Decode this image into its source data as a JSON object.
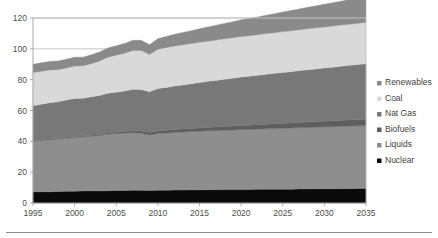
{
  "chart_data": {
    "type": "area",
    "title": "",
    "subtitle": "",
    "xlabel": "",
    "ylabel": "",
    "xlim": [
      1995,
      2035
    ],
    "ylim": [
      0,
      120
    ],
    "yticks": [
      0,
      20,
      40,
      60,
      80,
      100,
      120
    ],
    "xticks": [
      1995,
      2000,
      2005,
      2010,
      2015,
      2020,
      2025,
      2030,
      2035
    ],
    "grid": true,
    "stacked": true,
    "legend_position": "right",
    "x": [
      1995,
      1996,
      1997,
      1998,
      1999,
      2000,
      2001,
      2002,
      2003,
      2004,
      2005,
      2006,
      2007,
      2008,
      2009,
      2010,
      2011,
      2012,
      2013,
      2014,
      2015,
      2016,
      2017,
      2018,
      2019,
      2020,
      2021,
      2022,
      2023,
      2024,
      2025,
      2026,
      2027,
      2028,
      2029,
      2030,
      2031,
      2032,
      2033,
      2034,
      2035
    ],
    "stack_order_bottom_to_top": [
      "Nuclear",
      "Liquids",
      "Biofuels",
      "Nat Gas",
      "Coal",
      "Renewables"
    ],
    "series": [
      {
        "name": "Nuclear",
        "color": "#0a0a0a",
        "values": [
          7.2,
          7.3,
          7.3,
          7.4,
          7.6,
          7.7,
          7.8,
          7.9,
          7.8,
          8.0,
          8.1,
          8.1,
          8.2,
          8.2,
          8.1,
          8.3,
          8.3,
          8.4,
          8.4,
          8.5,
          8.5,
          8.6,
          8.6,
          8.7,
          8.7,
          8.8,
          8.8,
          8.9,
          8.9,
          9.0,
          9.0,
          9.0,
          9.1,
          9.1,
          9.2,
          9.2,
          9.2,
          9.3,
          9.3,
          9.4,
          9.4
        ]
      },
      {
        "name": "Liquids",
        "color": "#8e8e8e",
        "values": [
          32.8,
          33.3,
          33.8,
          34.0,
          34.6,
          35.0,
          35.1,
          35.4,
          36.0,
          36.8,
          37.0,
          37.2,
          37.5,
          37.0,
          36.0,
          36.8,
          37.1,
          37.4,
          37.6,
          37.8,
          38.0,
          38.2,
          38.3,
          38.5,
          38.6,
          38.8,
          38.9,
          39.0,
          39.2,
          39.3,
          39.5,
          39.6,
          39.8,
          39.9,
          40.0,
          40.2,
          40.3,
          40.4,
          40.6,
          40.7,
          40.8
        ]
      },
      {
        "name": "Biofuels",
        "color": "#5e5e5e",
        "values": [
          0.3,
          0.3,
          0.4,
          0.4,
          0.4,
          0.5,
          0.5,
          0.6,
          0.7,
          0.8,
          0.9,
          1.1,
          1.3,
          1.5,
          1.6,
          1.7,
          1.8,
          1.9,
          2.0,
          2.1,
          2.2,
          2.3,
          2.4,
          2.5,
          2.6,
          2.7,
          2.8,
          2.9,
          3.0,
          3.1,
          3.2,
          3.3,
          3.4,
          3.5,
          3.6,
          3.7,
          3.8,
          3.9,
          4.0,
          4.1,
          4.2
        ]
      },
      {
        "name": "Nat Gas",
        "color": "#787878",
        "values": [
          22.8,
          23.2,
          23.6,
          23.8,
          24.2,
          24.6,
          24.6,
          25.0,
          25.2,
          25.6,
          25.9,
          26.2,
          26.8,
          27.0,
          26.4,
          27.4,
          27.8,
          28.2,
          28.6,
          29.0,
          29.4,
          29.8,
          30.2,
          30.6,
          31.0,
          31.4,
          31.7,
          32.0,
          32.4,
          32.7,
          33.0,
          33.3,
          33.6,
          33.9,
          34.2,
          34.5,
          34.8,
          35.1,
          35.4,
          35.6,
          35.9
        ]
      },
      {
        "name": "Coal",
        "color": "#d9d9d9",
        "values": [
          21.5,
          21.3,
          21.2,
          20.9,
          20.8,
          21.0,
          21.0,
          21.4,
          22.4,
          23.4,
          24.0,
          24.6,
          25.2,
          25.2,
          24.2,
          25.6,
          25.8,
          25.9,
          26.0,
          26.0,
          26.1,
          26.1,
          26.2,
          26.2,
          26.3,
          26.3,
          26.3,
          26.4,
          26.4,
          26.4,
          26.5,
          26.5,
          26.5,
          26.6,
          26.6,
          26.6,
          26.7,
          26.7,
          26.7,
          26.8,
          26.8
        ]
      },
      {
        "name": "Renewables",
        "color": "#8a8a8a",
        "values": [
          5.4,
          5.5,
          5.5,
          5.6,
          5.7,
          5.8,
          5.6,
          5.8,
          5.9,
          6.0,
          6.1,
          6.3,
          6.5,
          6.6,
          6.3,
          6.8,
          7.2,
          7.6,
          8.0,
          8.4,
          8.8,
          9.2,
          9.6,
          10.0,
          10.4,
          10.8,
          11.2,
          11.5,
          11.9,
          12.3,
          12.7,
          13.1,
          13.5,
          13.9,
          14.3,
          14.7,
          15.1,
          15.5,
          15.9,
          16.3,
          16.7
        ]
      }
    ],
    "legend_entries": [
      {
        "label": "Renewables",
        "color": "#8a8a8a"
      },
      {
        "label": "Coal",
        "color": "#d9d9d9"
      },
      {
        "label": "Nat Gas",
        "color": "#787878"
      },
      {
        "label": "Biofuels",
        "color": "#5e5e5e"
      },
      {
        "label": "Liquids",
        "color": "#8e8e8e"
      },
      {
        "label": "Nuclear",
        "color": "#0a0a0a"
      }
    ]
  },
  "axis": {
    "y_tick_labels": [
      "120",
      "100",
      "80",
      "60",
      "40",
      "20",
      "0"
    ],
    "x_tick_labels": [
      "1995",
      "2000",
      "2005",
      "2010",
      "2015",
      "2020",
      "2025",
      "2030",
      "2035"
    ]
  },
  "legend": {
    "items": [
      {
        "label": "Renewables"
      },
      {
        "label": "Coal"
      },
      {
        "label": "Nat Gas"
      },
      {
        "label": "Biofuels"
      },
      {
        "label": "Liquids"
      },
      {
        "label": "Nuclear"
      }
    ]
  }
}
